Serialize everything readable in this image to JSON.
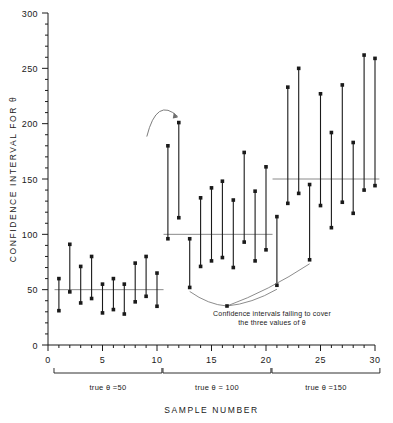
{
  "chart_data": {
    "type": "line",
    "title": "",
    "xlabel": "SAMPLE NUMBER",
    "ylabel": "CONFIDENCE INTERVAL FOR θ",
    "xlim": [
      0,
      30
    ],
    "ylim": [
      0,
      300
    ],
    "grid": false,
    "legend": "none",
    "xticks": [
      0,
      5,
      10,
      15,
      20,
      25,
      30
    ],
    "xtick_labels": [
      "0",
      "5",
      "10",
      "15",
      "20",
      "25",
      "30"
    ],
    "yticks": [
      0,
      50,
      100,
      150,
      200,
      250,
      300
    ],
    "ytick_labels": [
      "0",
      "50",
      "100",
      "150",
      "200",
      "250",
      "300"
    ],
    "xminor_step": 1,
    "yminor_step": 10,
    "series_description": "Vertical confidence interval bars with square endpoint markers; each bar spans lower to upper limit for one sample.",
    "reference_lines": [
      {
        "label": "true θ = 50",
        "value": 50,
        "x_from": 0.6,
        "x_to": 10.6
      },
      {
        "label": "true θ = 100",
        "value": 100,
        "x_from": 10.6,
        "x_to": 20.6
      },
      {
        "label": "true θ = 150",
        "value": 150,
        "x_from": 20.6,
        "x_to": 30.4
      }
    ],
    "groups": [
      {
        "name": "true θ = 50",
        "theta": 50,
        "samples_from": 1,
        "samples_to": 10,
        "bracket_label": "true θ =50"
      },
      {
        "name": "true θ = 100",
        "theta": 100,
        "samples_from": 11,
        "samples_to": 20,
        "bracket_label": "true θ = 100"
      },
      {
        "name": "true θ = 150",
        "theta": 150,
        "samples_from": 21,
        "samples_to": 30,
        "bracket_label": "true θ =150"
      }
    ],
    "intervals": [
      {
        "sample": 1,
        "lower": 31,
        "upper": 60,
        "covers": true
      },
      {
        "sample": 2,
        "lower": 48,
        "upper": 91,
        "covers": true
      },
      {
        "sample": 3,
        "lower": 38,
        "upper": 71,
        "covers": true
      },
      {
        "sample": 4,
        "lower": 42,
        "upper": 80,
        "covers": true
      },
      {
        "sample": 5,
        "lower": 29,
        "upper": 55,
        "covers": true
      },
      {
        "sample": 6,
        "lower": 32,
        "upper": 60,
        "covers": true
      },
      {
        "sample": 7,
        "lower": 28,
        "upper": 55,
        "covers": true
      },
      {
        "sample": 8,
        "lower": 39,
        "upper": 74,
        "covers": true
      },
      {
        "sample": 9,
        "lower": 44,
        "upper": 80,
        "covers": true
      },
      {
        "sample": 10,
        "lower": 35,
        "upper": 65,
        "covers": true
      },
      {
        "sample": 11,
        "lower": 96,
        "upper": 180,
        "covers": true
      },
      {
        "sample": 12,
        "lower": 115,
        "upper": 201,
        "covers": false
      },
      {
        "sample": 13,
        "lower": 52,
        "upper": 96,
        "covers": false
      },
      {
        "sample": 14,
        "lower": 71,
        "upper": 133,
        "covers": true
      },
      {
        "sample": 15,
        "lower": 76,
        "upper": 142,
        "covers": true
      },
      {
        "sample": 16,
        "lower": 79,
        "upper": 148,
        "covers": true
      },
      {
        "sample": 17,
        "lower": 70,
        "upper": 131,
        "covers": true
      },
      {
        "sample": 18,
        "lower": 93,
        "upper": 174,
        "covers": true
      },
      {
        "sample": 19,
        "lower": 76,
        "upper": 139,
        "covers": true
      },
      {
        "sample": 20,
        "lower": 86,
        "upper": 161,
        "covers": true
      },
      {
        "sample": 21,
        "lower": 54,
        "upper": 116,
        "covers": false
      },
      {
        "sample": 22,
        "lower": 128,
        "upper": 233,
        "covers": true
      },
      {
        "sample": 23,
        "lower": 137,
        "upper": 250,
        "covers": true
      },
      {
        "sample": 24,
        "lower": 77,
        "upper": 145,
        "covers": false
      },
      {
        "sample": 25,
        "lower": 126,
        "upper": 227,
        "covers": true
      },
      {
        "sample": 26,
        "lower": 106,
        "upper": 192,
        "covers": true
      },
      {
        "sample": 27,
        "lower": 129,
        "upper": 235,
        "covers": true
      },
      {
        "sample": 28,
        "lower": 119,
        "upper": 183,
        "covers": true
      },
      {
        "sample": 29,
        "lower": 140,
        "upper": 262,
        "covers": true
      },
      {
        "sample": 30,
        "lower": 144,
        "upper": 259,
        "covers": true
      }
    ],
    "annotations": [
      {
        "text_line1": "Confidence intervals failing to cover",
        "text_line2": "the three values of θ",
        "points_to_samples": [
          13,
          21,
          24
        ]
      },
      {
        "type": "arc-pointer",
        "points_to_sample": 12,
        "note": "curved arc indicating the upper endpoint of sample 12"
      }
    ]
  },
  "colors": {
    "axis": "#1a1a1a",
    "bar": "#1a1a1a",
    "marker": "#1a1a1a",
    "reference_line": "#8a8a8a",
    "leader": "#6e6e6e",
    "background": "#ffffff"
  }
}
